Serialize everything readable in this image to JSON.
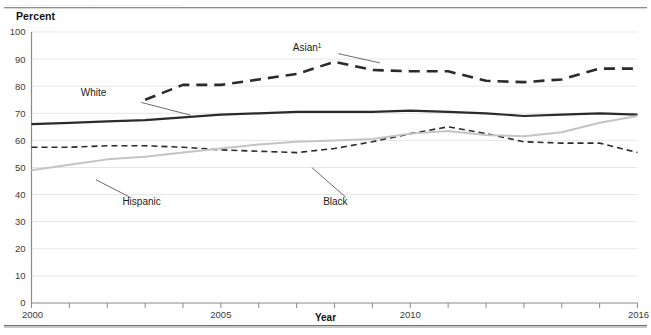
{
  "figure": {
    "clipped_header_text": "……………………………………………………………",
    "y_axis_title": "Percent",
    "x_axis_title": "Year"
  },
  "axis": {
    "y_ticks": [
      "0",
      "10",
      "20",
      "30",
      "40",
      "50",
      "60",
      "70",
      "80",
      "90",
      "100"
    ],
    "x_ticks_labeled": [
      "2000",
      "2005",
      "2010",
      "2016"
    ]
  },
  "series_labels": {
    "white": "White",
    "black": "Black",
    "hispanic": "Hispanic",
    "asian": "Asian",
    "asian_footnote_marker": "1"
  },
  "colors": {
    "white_series": "#2b2b2b",
    "black_series": "#2b2b2b",
    "asian_series": "#2b2b2b",
    "hispanic_series": "#c4c4c4",
    "gridline": "#e6e6e6",
    "axis": "#8a8a8a",
    "background": "#ffffff"
  },
  "chart_data": {
    "type": "line",
    "title": "",
    "subtitle": "",
    "xlabel": "Year",
    "ylabel": "Percent",
    "xlim": [
      2000,
      2016
    ],
    "ylim": [
      0,
      100
    ],
    "ytick_step": 10,
    "grid": true,
    "legend": "inline-annotations",
    "x": [
      2000,
      2001,
      2002,
      2003,
      2004,
      2005,
      2006,
      2007,
      2008,
      2009,
      2010,
      2011,
      2012,
      2013,
      2014,
      2015,
      2016
    ],
    "series": [
      {
        "name": "White",
        "style": "solid",
        "color": "#2b2b2b",
        "width": 2.2,
        "values": [
          66,
          66.5,
          67,
          67.5,
          68.5,
          69.5,
          70,
          70.5,
          70.5,
          70.5,
          71,
          70.5,
          70,
          69,
          69.5,
          70,
          69.5
        ]
      },
      {
        "name": "Black",
        "style": "dashed",
        "color": "#2b2b2b",
        "width": 1.6,
        "values": [
          57.5,
          57.5,
          58,
          58,
          57.5,
          56.5,
          56,
          55.5,
          57,
          59.5,
          62.5,
          65,
          62.5,
          59.5,
          59,
          59,
          55.5
        ]
      },
      {
        "name": "Hispanic",
        "style": "solid",
        "color": "#c4c4c4",
        "width": 2.0,
        "values": [
          49,
          51,
          53,
          54,
          55.5,
          57,
          58.5,
          59.5,
          60,
          60.5,
          62.5,
          63.5,
          62,
          61.5,
          63,
          66.5,
          69
        ]
      },
      {
        "name": "Asian",
        "style": "dashed",
        "color": "#2b2b2b",
        "width": 2.6,
        "values": [
          null,
          null,
          null,
          75,
          80.5,
          80.5,
          82.5,
          84.5,
          89,
          86,
          85.5,
          85.5,
          82,
          81.5,
          82.5,
          86.5,
          86.5
        ]
      }
    ],
    "annotations": [
      {
        "text": "White",
        "x": 2001.3,
        "y": 76.5
      },
      {
        "text": "Hispanic",
        "x": 2002.4,
        "y": 36.0
      },
      {
        "text": "Black",
        "x": 2007.7,
        "y": 36.0
      },
      {
        "text": "Asian",
        "x": 2006.9,
        "y": 93.0
      }
    ]
  }
}
